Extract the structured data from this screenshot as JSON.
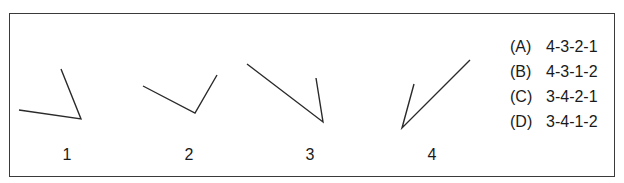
{
  "figures": [
    {
      "label": "1",
      "points": [
        [
          19,
          110
        ],
        [
          81,
          119
        ],
        [
          61,
          69
        ]
      ]
    },
    {
      "label": "2",
      "points": [
        [
          143,
          86
        ],
        [
          195,
          113
        ],
        [
          217,
          75
        ]
      ]
    },
    {
      "label": "3",
      "points": [
        [
          247,
          64
        ],
        [
          323,
          122
        ],
        [
          316,
          78
        ]
      ]
    },
    {
      "label": "4",
      "points": [
        [
          414,
          84
        ],
        [
          402,
          128
        ],
        [
          470,
          60
        ]
      ]
    }
  ],
  "options": [
    {
      "letter": "(A)",
      "text": "4-3-2-1"
    },
    {
      "letter": "(B)",
      "text": "4-3-1-2"
    },
    {
      "letter": "(C)",
      "text": "3-4-2-1"
    },
    {
      "letter": "(D)",
      "text": "3-4-1-2"
    }
  ],
  "colors": {
    "line": "#2a2a2a",
    "frame": "#3a3a3a"
  }
}
